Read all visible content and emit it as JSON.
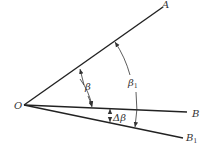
{
  "diagram": {
    "type": "angle-diagram",
    "colors": {
      "line": "#222222",
      "text": "#333333",
      "background": "#ffffff"
    },
    "points": {
      "O": {
        "label": "O",
        "x": 24,
        "y": 105
      },
      "A": {
        "label": "A",
        "x": 163,
        "y": 7
      },
      "B": {
        "label": "B",
        "x": 187,
        "y": 112
      },
      "B1": {
        "label": "B",
        "sub": "1",
        "x": 183,
        "y": 138
      }
    },
    "rays": [
      {
        "id": "OA",
        "from": "O",
        "to": "A"
      },
      {
        "id": "OB",
        "from": "O",
        "to": "B"
      },
      {
        "id": "OB1",
        "from": "O",
        "to": "B1"
      }
    ],
    "angles": {
      "beta": {
        "label": "β",
        "between": [
          "OA",
          "OB"
        ]
      },
      "beta1": {
        "label": "β",
        "sub": "1",
        "between": [
          "OA",
          "OB1"
        ]
      },
      "delta_beta": {
        "label": "Δβ",
        "between": [
          "OB",
          "OB1"
        ]
      }
    }
  }
}
